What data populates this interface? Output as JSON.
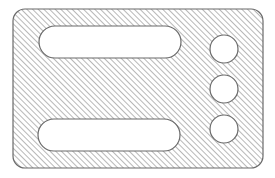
{
  "diagram": {
    "type": "hatched-cross-section",
    "colors": {
      "background": "#ffffff",
      "outline": "#6a6a6a",
      "hatch": "#9a9a9a",
      "hole_fill": "#ffffff"
    },
    "hatch": {
      "angle_deg": 45,
      "spacing_px": 4
    },
    "plate": {
      "x": 13,
      "y": 9,
      "width": 250,
      "height": 159,
      "corner_radius": 12
    },
    "slots": [
      {
        "id": "slot-top",
        "x": 39,
        "y": 26,
        "width": 142,
        "height": 32
      },
      {
        "id": "slot-bottom",
        "x": 38,
        "y": 119,
        "width": 142,
        "height": 32
      }
    ],
    "holes": [
      {
        "id": "hole-top",
        "cx": 224,
        "cy": 49,
        "r": 14
      },
      {
        "id": "hole-middle",
        "cx": 224,
        "cy": 89,
        "r": 14
      },
      {
        "id": "hole-bottom",
        "cx": 224,
        "cy": 129,
        "r": 14
      }
    ]
  }
}
